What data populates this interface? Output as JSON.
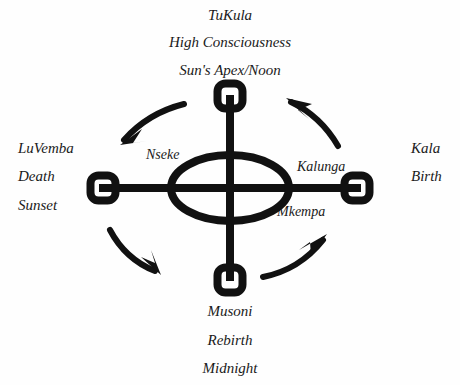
{
  "figure": {
    "title_group_top": {
      "line1": "TuKula",
      "line2": "High Consciousness",
      "line3": "Sun's Apex/Noon"
    },
    "label_group_bottom": {
      "line1": "Musoni",
      "line2": "Rebirth",
      "line3": "Midnight"
    },
    "label_group_left": {
      "line1": "LuVemba",
      "line2": "Death",
      "line3": "Sunset"
    },
    "label_group_right": {
      "line1": "Kala",
      "line2": "Birth"
    },
    "inner_labels": {
      "upper_left": "Nseke",
      "right": "Kalunga",
      "lower_right": "Mkempa"
    },
    "colors": {
      "ink": "#111111",
      "background": "#fefefe"
    },
    "nodes": [
      {
        "name": "top-node",
        "position": "top"
      },
      {
        "name": "left-node",
        "position": "left"
      },
      {
        "name": "right-node",
        "position": "right"
      },
      {
        "name": "bottom-node",
        "position": "bottom"
      }
    ],
    "arrows": [
      {
        "name": "arrow-upper-left",
        "direction": "down-left"
      },
      {
        "name": "arrow-lower-left",
        "direction": "down-right"
      },
      {
        "name": "arrow-lower-right",
        "direction": "up-right"
      },
      {
        "name": "arrow-upper-right",
        "direction": "up-left"
      }
    ]
  }
}
